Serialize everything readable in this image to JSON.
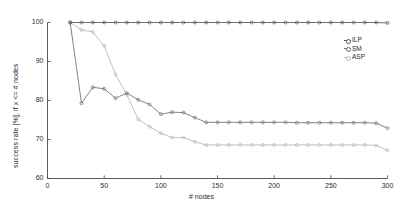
{
  "chart_data": {
    "type": "line",
    "title": "",
    "xlabel": "# nodes",
    "ylabel": "success rate [%], if x <= # nodes",
    "xlim": [
      0,
      300
    ],
    "ylim": [
      60,
      100
    ],
    "xticks": [
      0,
      50,
      100,
      150,
      200,
      250,
      300
    ],
    "yticks": [
      60,
      70,
      80,
      90,
      100
    ],
    "grid": false,
    "legend_position": "upper-right",
    "x": [
      20,
      30,
      40,
      50,
      60,
      70,
      80,
      90,
      100,
      110,
      120,
      130,
      140,
      150,
      160,
      170,
      180,
      190,
      200,
      210,
      220,
      230,
      240,
      250,
      260,
      270,
      280,
      290,
      300
    ],
    "series": [
      {
        "name": "ILP",
        "color": "#555555",
        "marker": "circle",
        "values": [
          100,
          100,
          100,
          100,
          100,
          100,
          100,
          100,
          100,
          100,
          100,
          100,
          100,
          100,
          100,
          100,
          100,
          100,
          100,
          100,
          100,
          100,
          100,
          100,
          100,
          100,
          100,
          100,
          99.9
        ]
      },
      {
        "name": "SM",
        "color": "#6e6e6e",
        "marker": "circle",
        "values": [
          100,
          79.3,
          83.4,
          83.0,
          80.6,
          81.9,
          80.2,
          79.0,
          76.5,
          77.0,
          76.9,
          75.6,
          74.4,
          74.4,
          74.4,
          74.4,
          74.4,
          74.4,
          74.4,
          74.4,
          74.3,
          74.3,
          74.3,
          74.3,
          74.3,
          74.3,
          74.3,
          74.2,
          72.9
        ]
      },
      {
        "name": "ASP",
        "color": "#b5b5b5",
        "marker": "circle",
        "values": [
          100,
          98.1,
          97.6,
          94.0,
          86.7,
          81.5,
          75.2,
          73.3,
          71.6,
          70.5,
          70.5,
          69.4,
          68.6,
          68.6,
          68.6,
          68.6,
          68.6,
          68.6,
          68.6,
          68.6,
          68.6,
          68.6,
          68.6,
          68.6,
          68.6,
          68.6,
          68.6,
          68.5,
          67.2
        ]
      }
    ]
  },
  "legend": {
    "items": [
      {
        "label": "ILP",
        "color": "#555555"
      },
      {
        "label": "SM",
        "color": "#6e6e6e"
      },
      {
        "label": "ASP",
        "color": "#b5b5b5"
      }
    ]
  },
  "axes": {
    "x_label": "# nodes",
    "y_label": "success rate [%], if x <= # nodes",
    "x_tick_labels": [
      "0",
      "50",
      "100",
      "150",
      "200",
      "250",
      "300"
    ],
    "y_tick_labels": [
      "60",
      "70",
      "80",
      "90",
      "100"
    ]
  }
}
